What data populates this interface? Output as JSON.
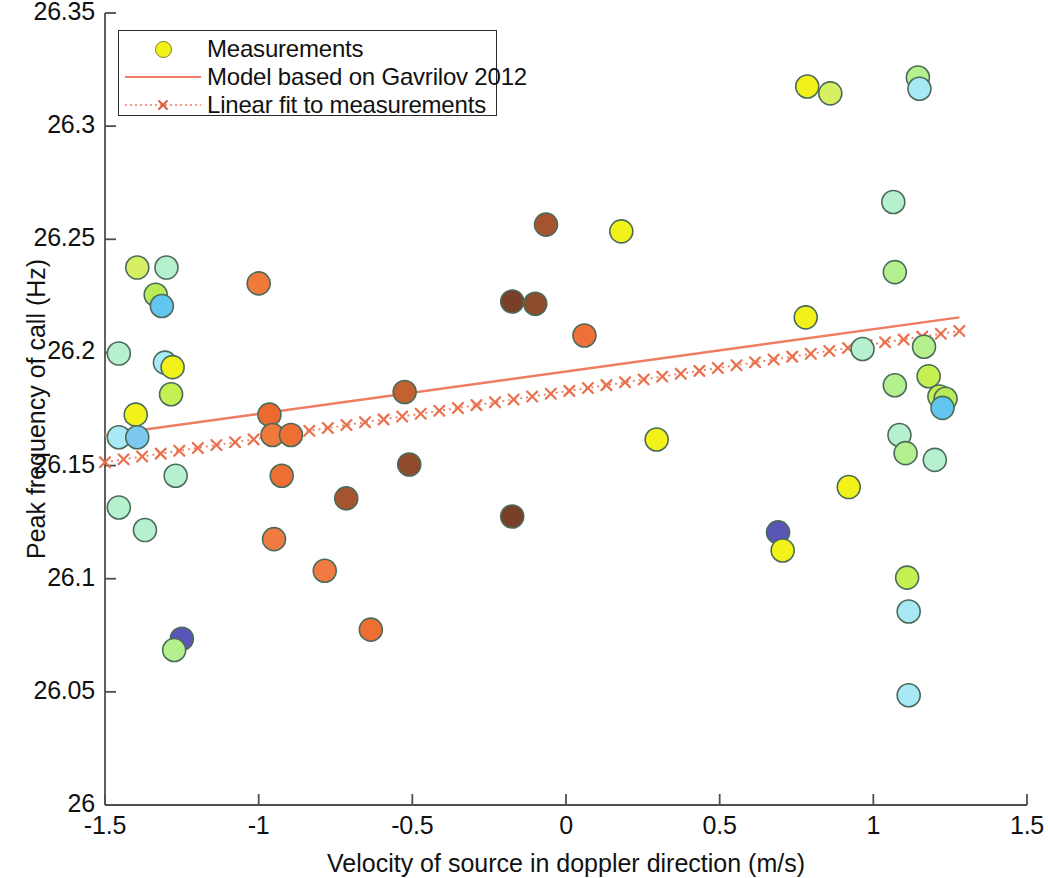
{
  "chart_data": {
    "type": "scatter",
    "title": "",
    "xlabel": "Velocity of source in doppler direction (m/s)",
    "ylabel": "Peak frequency of call (Hz)",
    "xlim": [
      -1.5,
      1.5
    ],
    "ylim": [
      26,
      26.35
    ],
    "xticks": [
      "-1.5",
      "-1",
      "-0.5",
      "0",
      "0.5",
      "1",
      "1.5"
    ],
    "xtickvals": [
      -1.5,
      -1,
      -0.5,
      0,
      0.5,
      1,
      1.5
    ],
    "yticks": [
      "26",
      "26.05",
      "26.1",
      "26.15",
      "26.2",
      "26.25",
      "26.3",
      "26.35"
    ],
    "ytickvals": [
      26,
      26.05,
      26.1,
      26.15,
      26.2,
      26.25,
      26.3,
      26.35
    ],
    "grid": false,
    "legend_position": "top-left",
    "marker_edge_color": "#4a6b5a",
    "series": [
      {
        "name": "Measurements",
        "type": "scatter",
        "marker": "circle",
        "points": [
          {
            "x": -1.455,
            "y": 26.1995,
            "color": "#b7f0cf"
          },
          {
            "x": -1.455,
            "y": 26.1625,
            "color": "#a9e8f5"
          },
          {
            "x": -1.455,
            "y": 26.1315,
            "color": "#b7f0cf"
          },
          {
            "x": -1.395,
            "y": 26.2375,
            "color": "#d7ef63"
          },
          {
            "x": -1.4,
            "y": 26.1725,
            "color": "#f2f21a"
          },
          {
            "x": -1.395,
            "y": 26.1625,
            "color": "#7ec8f0"
          },
          {
            "x": -1.37,
            "y": 26.1215,
            "color": "#b7f0cf"
          },
          {
            "x": -1.335,
            "y": 26.2255,
            "color": "#b9ea58"
          },
          {
            "x": -1.315,
            "y": 26.2205,
            "color": "#62c6ee"
          },
          {
            "x": -1.3,
            "y": 26.2375,
            "color": "#b7f0cf"
          },
          {
            "x": -1.305,
            "y": 26.1955,
            "color": "#a9e8f5"
          },
          {
            "x": -1.28,
            "y": 26.1935,
            "color": "#f2f21a"
          },
          {
            "x": -1.285,
            "y": 26.1815,
            "color": "#c6ef52"
          },
          {
            "x": -1.27,
            "y": 26.1455,
            "color": "#b7f0cf"
          },
          {
            "x": -1.25,
            "y": 26.0735,
            "color": "#5a56b8"
          },
          {
            "x": -1.275,
            "y": 26.0685,
            "color": "#b5f08f"
          },
          {
            "x": -1.0,
            "y": 26.2305,
            "color": "#f07a3c"
          },
          {
            "x": -0.965,
            "y": 26.1725,
            "color": "#ec6a2e"
          },
          {
            "x": -0.955,
            "y": 26.1635,
            "color": "#f07a3c"
          },
          {
            "x": -0.95,
            "y": 26.1175,
            "color": "#ef7a42"
          },
          {
            "x": -0.925,
            "y": 26.1455,
            "color": "#ee6f33"
          },
          {
            "x": -0.895,
            "y": 26.1635,
            "color": "#ee6f33"
          },
          {
            "x": -0.785,
            "y": 26.1035,
            "color": "#ef7a42"
          },
          {
            "x": -0.715,
            "y": 26.1355,
            "color": "#a65330"
          },
          {
            "x": -0.635,
            "y": 26.0775,
            "color": "#ee6f33"
          },
          {
            "x": -0.525,
            "y": 26.1825,
            "color": "#c2622f"
          },
          {
            "x": -0.51,
            "y": 26.1505,
            "color": "#8f4a2c"
          },
          {
            "x": -0.175,
            "y": 26.2225,
            "color": "#7a3f28"
          },
          {
            "x": -0.175,
            "y": 26.1275,
            "color": "#7a3f28"
          },
          {
            "x": -0.1,
            "y": 26.2215,
            "color": "#8f4a2c"
          },
          {
            "x": -0.065,
            "y": 26.2565,
            "color": "#a65330"
          },
          {
            "x": 0.06,
            "y": 26.2075,
            "color": "#f0703a"
          },
          {
            "x": 0.18,
            "y": 26.2535,
            "color": "#f2f21a"
          },
          {
            "x": 0.295,
            "y": 26.1615,
            "color": "#f2f21a"
          },
          {
            "x": 0.69,
            "y": 26.1205,
            "color": "#5a56b8"
          },
          {
            "x": 0.705,
            "y": 26.1125,
            "color": "#f2f21a"
          },
          {
            "x": 0.78,
            "y": 26.2155,
            "color": "#f2f21a"
          },
          {
            "x": 0.785,
            "y": 26.3175,
            "color": "#f2f21a"
          },
          {
            "x": 0.86,
            "y": 26.3145,
            "color": "#d7ef63"
          },
          {
            "x": 0.92,
            "y": 26.1405,
            "color": "#f2f21a"
          },
          {
            "x": 0.965,
            "y": 26.2015,
            "color": "#b7f0cf"
          },
          {
            "x": 1.065,
            "y": 26.2665,
            "color": "#b7f0cf"
          },
          {
            "x": 1.07,
            "y": 26.2355,
            "color": "#b5f08f"
          },
          {
            "x": 1.07,
            "y": 26.1855,
            "color": "#b5f08f"
          },
          {
            "x": 1.085,
            "y": 26.1635,
            "color": "#b7f0cf"
          },
          {
            "x": 1.105,
            "y": 26.1555,
            "color": "#b5f08f"
          },
          {
            "x": 1.11,
            "y": 26.1005,
            "color": "#c6ef52"
          },
          {
            "x": 1.115,
            "y": 26.0855,
            "color": "#a9e8f5"
          },
          {
            "x": 1.115,
            "y": 26.0485,
            "color": "#a9e8f5"
          },
          {
            "x": 1.145,
            "y": 26.3215,
            "color": "#b5f08f"
          },
          {
            "x": 1.15,
            "y": 26.3165,
            "color": "#a9e8f5"
          },
          {
            "x": 1.165,
            "y": 26.2025,
            "color": "#b5f08f"
          },
          {
            "x": 1.18,
            "y": 26.1895,
            "color": "#c6ef52"
          },
          {
            "x": 1.2,
            "y": 26.1525,
            "color": "#b7f0cf"
          },
          {
            "x": 1.215,
            "y": 26.1805,
            "color": "#c6ef52"
          },
          {
            "x": 1.235,
            "y": 26.1795,
            "color": "#b9ea58"
          },
          {
            "x": 1.225,
            "y": 26.1755,
            "color": "#62c6ee"
          }
        ]
      },
      {
        "name": "Model based on Gavrilov 2012",
        "type": "line",
        "style": "solid",
        "color": "#ef7d61",
        "x": [
          -1.5,
          1.28
        ],
        "y": [
          26.1635,
          26.2155
        ]
      },
      {
        "name": "Linear fit to measurements",
        "type": "line",
        "style": "dotted-with-x-markers",
        "color": "#ef7d61",
        "x": [
          -1.5,
          1.28
        ],
        "y": [
          26.1515,
          26.2095
        ]
      }
    ]
  },
  "legend": {
    "items": [
      {
        "label": "Measurements",
        "symbol": "marker-circle"
      },
      {
        "label": "Model based on Gavrilov 2012",
        "symbol": "line-solid"
      },
      {
        "label": "Linear fit to measurements",
        "symbol": "line-dotted-x"
      }
    ]
  },
  "axes": {
    "xlabel": "Velocity of source in doppler direction (m/s)",
    "ylabel": "Peak frequency of call (Hz)"
  }
}
